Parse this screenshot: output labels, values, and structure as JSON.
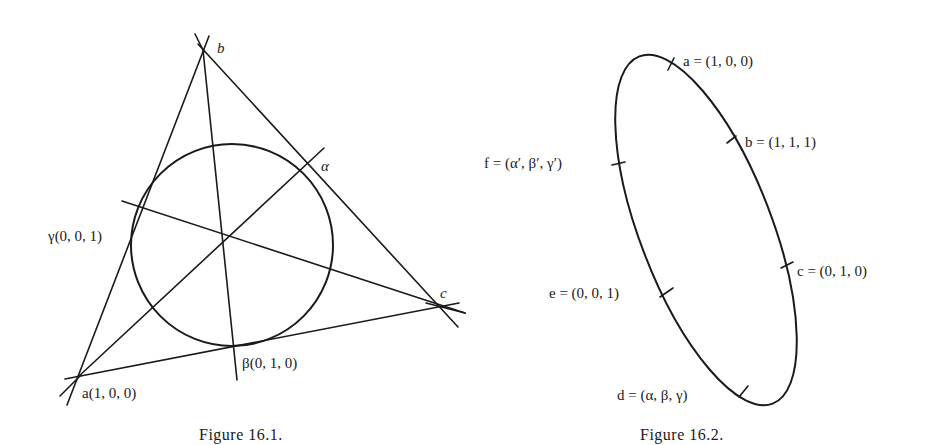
{
  "figures": [
    {
      "id": "fig-16-1",
      "caption": "Figure 16.1.",
      "description": "Triangle abc with inscribed circle tangent at α, β, γ; cevians meet at a common point",
      "vertices": {
        "b": {
          "label": "b"
        },
        "c": {
          "label": "c"
        },
        "a": {
          "label": "a(1, 0, 0)"
        }
      },
      "tangent_points": {
        "alpha": {
          "label": "α"
        },
        "beta": {
          "label": "β(0, 1, 0)"
        },
        "gamma": {
          "label": "γ(0, 0, 1)"
        }
      }
    },
    {
      "id": "fig-16-2",
      "caption": "Figure 16.2.",
      "description": "Conic (ellipse) through six marked points",
      "points": [
        {
          "name": "a",
          "label": "a = (1, 0, 0)"
        },
        {
          "name": "b",
          "label": "b = (1, 1, 1)"
        },
        {
          "name": "c",
          "label": "c = (0, 1, 0)"
        },
        {
          "name": "d",
          "label": "d = (α, β, γ)"
        },
        {
          "name": "e",
          "label": "e = (0, 0, 1)"
        },
        {
          "name": "f",
          "label": "f = (α′, β′, γ′)"
        }
      ]
    }
  ]
}
